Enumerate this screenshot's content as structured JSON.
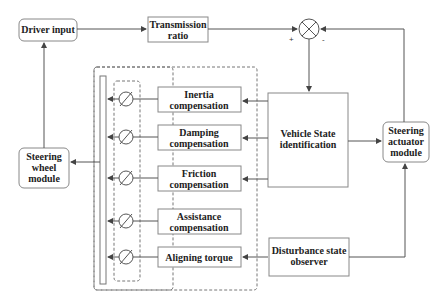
{
  "diagram": {
    "type": "block-diagram",
    "blocks": {
      "driver_input": [
        "Driver input"
      ],
      "transmission_ratio": [
        "Transmission",
        "ratio"
      ],
      "inertia": [
        "Inertia",
        "compensation"
      ],
      "damping": [
        "Damping",
        "compensation"
      ],
      "friction": [
        "Friction",
        "compensation"
      ],
      "assistance": [
        "Assistance",
        "compensation"
      ],
      "aligning": [
        "Aligning torque"
      ],
      "vehicle_state": [
        "Vehicle State",
        "identification"
      ],
      "steering_actuator": [
        "Steering",
        "actuator",
        "module"
      ],
      "steering_wheel": [
        "Steering",
        "wheel",
        "module"
      ],
      "disturbance": [
        "Disturbance state",
        "observer"
      ]
    },
    "summing_junction": {
      "plus": "+",
      "minus": "-"
    },
    "colors": {
      "line": "#555555",
      "box_border": "#888888",
      "dashed": "#777777",
      "text": "#222222"
    }
  }
}
